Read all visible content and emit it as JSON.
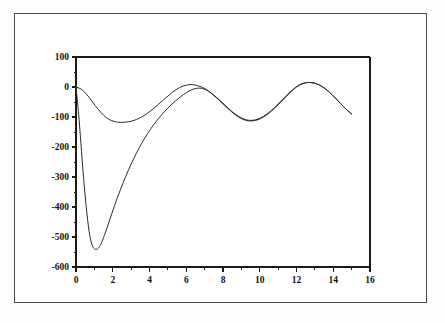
{
  "figure": {
    "background_color": "#ffffff",
    "border_color": "#4a4a4a",
    "axis_color": "#1a1a1a",
    "curve_color": "#2b2b2b"
  },
  "chart_data": {
    "type": "line",
    "title": "",
    "subtitle": "",
    "xlabel": "",
    "ylabel": "",
    "xlim": [
      0,
      16
    ],
    "ylim": [
      -600,
      100
    ],
    "grid": false,
    "legend": null,
    "xticks": [
      0,
      2,
      4,
      6,
      8,
      10,
      12,
      14,
      16
    ],
    "xtick_labels": [
      "0",
      "2",
      "4",
      "6",
      "8",
      "10",
      "12",
      "14",
      "16"
    ],
    "xminor_ticks": [
      1,
      3,
      5,
      7,
      9,
      11,
      13,
      15
    ],
    "yticks": [
      100,
      0,
      -100,
      -200,
      -300,
      -400,
      -500,
      -600
    ],
    "ytick_labels": [
      "100",
      "0",
      "-100",
      "-200",
      "-300",
      "-400",
      "-500",
      "-600"
    ],
    "series": [
      {
        "name": "shallow-response",
        "color": "#2b2b2b",
        "linewidth": 1.0,
        "x": [
          0.0,
          0.3,
          0.6,
          0.9,
          1.2,
          1.5,
          1.8,
          2.1,
          2.4,
          2.7,
          3.0,
          3.3,
          3.6,
          3.9,
          4.2,
          4.5,
          4.8,
          5.1,
          5.4,
          5.7,
          6.0,
          6.3,
          6.6,
          6.9,
          7.2,
          7.5,
          7.8,
          8.1,
          8.4,
          8.7,
          9.0,
          9.3,
          9.6,
          9.9,
          10.2,
          10.5,
          10.8,
          11.1,
          11.4,
          11.7,
          12.0,
          12.3,
          12.6,
          12.9,
          13.2,
          13.5,
          13.8,
          14.1,
          14.4,
          14.7,
          15.0
        ],
        "y": [
          0,
          -8,
          -26,
          -50,
          -74,
          -94,
          -108,
          -115,
          -118,
          -117,
          -114,
          -108,
          -99,
          -87,
          -73,
          -57,
          -41,
          -25,
          -11,
          0,
          6,
          8,
          5,
          -2,
          -13,
          -27,
          -43,
          -60,
          -77,
          -92,
          -103,
          -110,
          -111,
          -107,
          -98,
          -85,
          -69,
          -51,
          -32,
          -14,
          1,
          11,
          15,
          14,
          8,
          -3,
          -18,
          -36,
          -55,
          -74,
          -90
        ]
      },
      {
        "name": "transient-response",
        "color": "#2b2b2b",
        "linewidth": 1.0,
        "x": [
          0.0,
          0.15,
          0.3,
          0.45,
          0.6,
          0.75,
          0.9,
          1.05,
          1.2,
          1.35,
          1.5,
          1.8,
          2.1,
          2.4,
          2.7,
          3.0,
          3.3,
          3.6,
          3.9,
          4.2,
          4.5,
          4.8,
          5.1,
          5.4,
          5.7,
          6.0,
          6.3,
          6.6,
          6.9,
          7.2,
          7.5,
          7.8,
          8.1,
          8.4,
          8.7,
          9.0,
          9.3,
          9.6,
          9.9,
          10.2,
          10.5,
          10.8,
          11.1,
          11.4,
          11.7,
          12.0,
          12.3,
          12.6,
          12.9,
          13.2,
          13.5,
          13.8,
          14.1,
          14.4,
          14.7,
          15.0
        ],
        "y": [
          0,
          -95,
          -215,
          -330,
          -425,
          -495,
          -530,
          -541,
          -538,
          -524,
          -502,
          -449,
          -395,
          -345,
          -299,
          -257,
          -219,
          -185,
          -155,
          -128,
          -104,
          -83,
          -64,
          -47,
          -32,
          -19,
          -9,
          -4,
          -5,
          -14,
          -28,
          -45,
          -62,
          -79,
          -94,
          -105,
          -112,
          -113,
          -109,
          -100,
          -87,
          -71,
          -53,
          -34,
          -16,
          0,
          10,
          15,
          14,
          8,
          -3,
          -18,
          -36,
          -55,
          -74,
          -90
        ]
      }
    ]
  },
  "axes": {
    "left_spine": true,
    "bottom_spine": true,
    "top_spine": true,
    "right_spine": true
  }
}
